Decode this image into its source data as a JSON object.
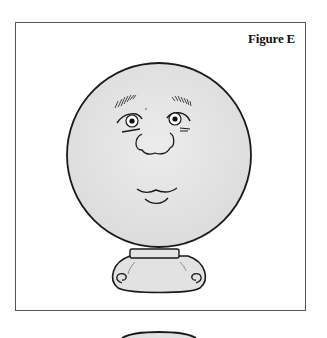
{
  "figure": {
    "caption": "Figure E",
    "colors": {
      "outline": "#1a1a1a",
      "fill": "#e6e6e6",
      "frame": "#555555",
      "background": "#ffffff"
    }
  }
}
